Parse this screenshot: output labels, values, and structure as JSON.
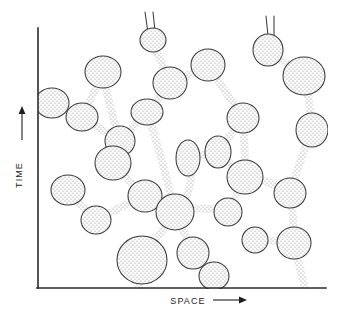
{
  "figure": {
    "title": "",
    "axes": {
      "x": {
        "label": "SPACE",
        "arrow": "right-arrow-icon",
        "line": {
          "x1": 38,
          "y1": 288,
          "x2": 326,
          "y2": 288
        }
      },
      "y": {
        "label": "TIME",
        "arrow": "up-arrow-icon",
        "line": {
          "x1": 38,
          "y1": 28,
          "x2": 38,
          "y2": 288
        }
      }
    },
    "colors": {
      "axis": "#2b2b2b",
      "outline": "#3a3a3a",
      "stipple": "#8a8a8a",
      "fill": "#ffffff",
      "text": "#1e1e1e"
    },
    "blobs": [
      {
        "name": "blob-left-edge-upper",
        "cx": 52,
        "cy": 103,
        "rx": 17,
        "ry": 15
      },
      {
        "name": "blob-upper-left-junction",
        "cx": 82,
        "cy": 117,
        "rx": 16,
        "ry": 14
      },
      {
        "name": "blob-top-left-round",
        "cx": 103,
        "cy": 72,
        "rx": 18,
        "ry": 16
      },
      {
        "name": "blob-upper-mid-node",
        "cx": 120,
        "cy": 141,
        "rx": 15,
        "ry": 15
      },
      {
        "name": "blob-top-center-small",
        "cx": 153,
        "cy": 40,
        "rx": 13,
        "ry": 12
      },
      {
        "name": "blob-top-center-lower",
        "cx": 170,
        "cy": 83,
        "rx": 17,
        "ry": 16
      },
      {
        "name": "blob-top-right-of-center",
        "cx": 208,
        "cy": 65,
        "rx": 17,
        "ry": 16
      },
      {
        "name": "blob-mid-left-oval",
        "cx": 147,
        "cy": 112,
        "rx": 16,
        "ry": 13
      },
      {
        "name": "blob-center-left",
        "cx": 113,
        "cy": 163,
        "rx": 18,
        "ry": 17
      },
      {
        "name": "blob-center-core",
        "cx": 145,
        "cy": 196,
        "rx": 17,
        "ry": 16
      },
      {
        "name": "blob-center-hub",
        "cx": 175,
        "cy": 212,
        "rx": 19,
        "ry": 18
      },
      {
        "name": "blob-mid-tall-oval",
        "cx": 188,
        "cy": 158,
        "rx": 12,
        "ry": 18
      },
      {
        "name": "blob-mid-right-oval",
        "cx": 218,
        "cy": 152,
        "rx": 13,
        "ry": 16
      },
      {
        "name": "blob-upper-right-round",
        "cx": 243,
        "cy": 118,
        "rx": 16,
        "ry": 15
      },
      {
        "name": "blob-right-center",
        "cx": 245,
        "cy": 177,
        "rx": 18,
        "ry": 17
      },
      {
        "name": "blob-right-lower",
        "cx": 228,
        "cy": 212,
        "rx": 14,
        "ry": 14
      },
      {
        "name": "blob-far-right-upper",
        "cx": 304,
        "cy": 76,
        "rx": 21,
        "ry": 19
      },
      {
        "name": "blob-far-right-tail",
        "cx": 268,
        "cy": 50,
        "rx": 15,
        "ry": 16
      },
      {
        "name": "blob-far-right-mid",
        "cx": 312,
        "cy": 130,
        "rx": 16,
        "ry": 17
      },
      {
        "name": "blob-far-right-low",
        "cx": 290,
        "cy": 193,
        "rx": 16,
        "ry": 15
      },
      {
        "name": "blob-far-right-bottom",
        "cx": 294,
        "cy": 243,
        "rx": 17,
        "ry": 16
      },
      {
        "name": "blob-lower-left-round",
        "cx": 68,
        "cy": 190,
        "rx": 17,
        "ry": 15
      },
      {
        "name": "blob-lower-left-small",
        "cx": 96,
        "cy": 220,
        "rx": 15,
        "ry": 14
      },
      {
        "name": "blob-bottom-big",
        "cx": 142,
        "cy": 260,
        "rx": 25,
        "ry": 24
      },
      {
        "name": "blob-bottom-center",
        "cx": 193,
        "cy": 253,
        "rx": 16,
        "ry": 16
      },
      {
        "name": "blob-bottom-right-lobe",
        "cx": 214,
        "cy": 276,
        "rx": 15,
        "ry": 14
      },
      {
        "name": "blob-bottom-right-pair",
        "cx": 255,
        "cy": 240,
        "rx": 13,
        "ry": 13
      }
    ],
    "tails": [
      {
        "name": "tail-top-center",
        "x": 152,
        "y_top": 12
      },
      {
        "name": "tail-top-right",
        "x": 272,
        "y_top": 16
      }
    ]
  }
}
